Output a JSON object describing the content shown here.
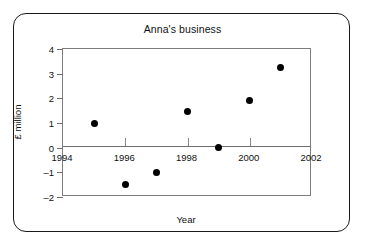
{
  "chart_data": {
    "type": "scatter",
    "title": "Anna's business",
    "xlabel": "Year",
    "ylabel": "£ million",
    "xlim": [
      1994,
      2002
    ],
    "ylim": [
      -2,
      4
    ],
    "grid": false,
    "legend": null,
    "zero_line": true,
    "x_ticks": [
      1994,
      1996,
      1998,
      2000,
      2002
    ],
    "x_tick_labels": [
      "1994",
      "1996",
      "1998",
      "2000",
      "2002"
    ],
    "y_ticks": [
      4,
      3,
      2,
      1,
      0,
      -1,
      -2
    ],
    "y_tick_labels": [
      "4",
      "3",
      "2",
      "1",
      "0",
      "–1",
      "–2"
    ],
    "x": [
      1995,
      1996,
      1997,
      1998,
      1999,
      2000,
      2001
    ],
    "y": [
      1.0,
      -1.5,
      -1.0,
      1.45,
      0.0,
      1.9,
      3.25
    ],
    "points": [
      {
        "x": 1995,
        "y": 1.0
      },
      {
        "x": 1996,
        "y": -1.5
      },
      {
        "x": 1997,
        "y": -1.0
      },
      {
        "x": 1998,
        "y": 1.45
      },
      {
        "x": 1999,
        "y": 0.0
      },
      {
        "x": 2000,
        "y": 1.9
      },
      {
        "x": 2001,
        "y": 3.25
      }
    ],
    "marker": "filled-circle",
    "marker_color": "#000000",
    "axis_color": "#6e6e6e",
    "text_color": "#111111",
    "background": "#ffffff"
  }
}
